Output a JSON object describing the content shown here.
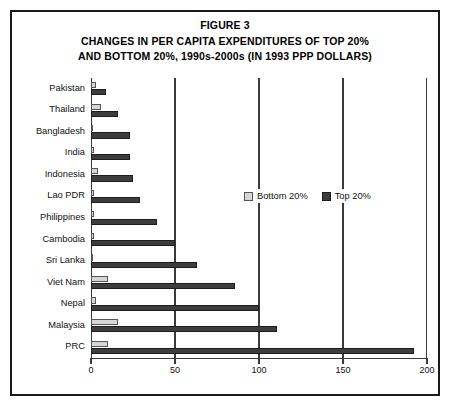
{
  "figure": {
    "label": "FIGURE 3",
    "title_line_1": "CHANGES IN PER CAPITA EXPENDITURES OF TOP 20%",
    "title_line_2": "AND BOTTOM 20%, 1990s-2000s (IN 1993 PPP DOLLARS)"
  },
  "legend": {
    "position": "inside-top-right",
    "items": [
      {
        "label": "Bottom 20%",
        "color": "#d6d6d6",
        "icon": "legend-swatch-icon"
      },
      {
        "label": "Top 20%",
        "color": "#3d3d3d",
        "icon": "legend-swatch-icon"
      }
    ]
  },
  "chart_data": {
    "type": "bar",
    "orientation": "horizontal",
    "title": "CHANGES IN PER CAPITA EXPENDITURES OF TOP 20% AND BOTTOM 20%, 1990s-2000s (IN 1993 PPP DOLLARS)",
    "xlabel": "",
    "ylabel": "",
    "xlim": [
      0,
      200
    ],
    "xticks": [
      0,
      50,
      100,
      150,
      200
    ],
    "xtick_labels": [
      "0",
      "50",
      "100",
      "150",
      "200"
    ],
    "grid": true,
    "categories": [
      "Pakistan",
      "Thailand",
      "Bangladesh",
      "India",
      "Indonesia",
      "Lao PDR",
      "Philippines",
      "Cambodia",
      "Sri Lanka",
      "Viet Nam",
      "Nepal",
      "Malaysia",
      "PRC"
    ],
    "series": [
      {
        "name": "Bottom 20%",
        "color": "#d6d6d6",
        "values": [
          3,
          6,
          1,
          2,
          4,
          2,
          2,
          2,
          1,
          10,
          3,
          16,
          10
        ]
      },
      {
        "name": "Top 20%",
        "color": "#3d3d3d",
        "values": [
          9,
          16,
          23,
          23,
          25,
          29,
          39,
          50,
          63,
          86,
          100,
          111,
          192
        ]
      }
    ]
  }
}
